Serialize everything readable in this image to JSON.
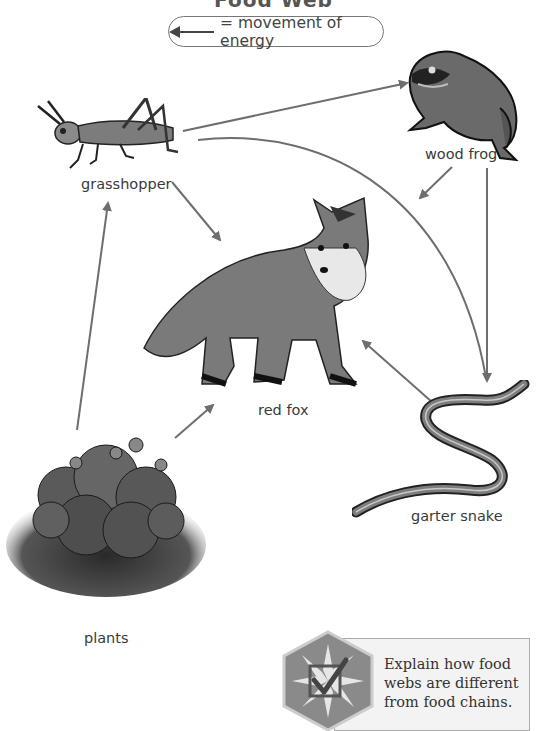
{
  "diagram": {
    "title": "Food Web",
    "legend": {
      "symbol": "arrow-left",
      "text": "= movement of energy"
    },
    "organisms": [
      {
        "id": "grasshopper",
        "label": "grasshopper"
      },
      {
        "id": "wood_frog",
        "label": "wood frog"
      },
      {
        "id": "red_fox",
        "label": "red fox"
      },
      {
        "id": "garter_snake",
        "label": "garter snake"
      },
      {
        "id": "plants",
        "label": "plants"
      }
    ],
    "energy_flows": [
      {
        "from": "plants",
        "to": "grasshopper"
      },
      {
        "from": "plants",
        "to": "red fox"
      },
      {
        "from": "grasshopper",
        "to": "wood frog"
      },
      {
        "from": "grasshopper",
        "to": "red fox"
      },
      {
        "from": "grasshopper",
        "to": "garter snake"
      },
      {
        "from": "wood frog",
        "to": "red fox"
      },
      {
        "from": "wood frog",
        "to": "garter snake"
      },
      {
        "from": "garter snake",
        "to": "red fox"
      }
    ],
    "arrow_color": "#6e6e6e"
  },
  "callout": {
    "icon": "checkmark-badge-icon",
    "text": "Explain how food webs are different from food chains."
  }
}
